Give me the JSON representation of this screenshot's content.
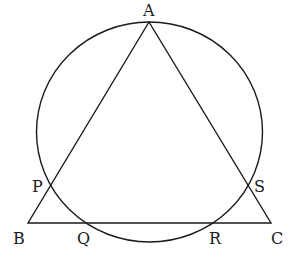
{
  "diagram": {
    "type": "geometry",
    "labels": {
      "A": "A",
      "B": "B",
      "C": "C",
      "P": "P",
      "Q": "Q",
      "R": "R",
      "S": "S"
    },
    "points": {
      "A": [
        149,
        22
      ],
      "B": [
        28,
        223
      ],
      "C": [
        271,
        223
      ],
      "P": [
        50,
        183
      ],
      "Q": [
        86,
        223
      ],
      "R": [
        213,
        223
      ],
      "S": [
        248,
        183
      ]
    },
    "circle": {
      "cx": 149.5,
      "cy": 132,
      "rx": 113,
      "ry": 110
    },
    "colors": {
      "stroke": "#1a1a1a",
      "background": "#ffffff"
    }
  }
}
